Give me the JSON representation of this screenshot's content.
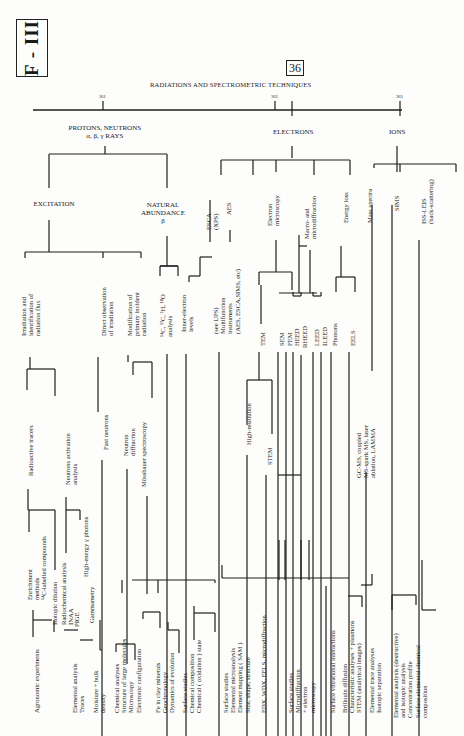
{
  "page": {
    "section_badge": "F - III",
    "chapter_number": "36",
    "title": "RADIATIONS AND SPECTROMETRIC TECHNIQUES",
    "tick_numbers": [
      {
        "label": "361",
        "x": 103,
        "y": 94
      },
      {
        "label": "362",
        "x": 275,
        "y": 94
      },
      {
        "label": "363",
        "x": 400,
        "y": 94
      }
    ]
  },
  "categories": [
    {
      "label": "PROTONS, NEUTRONS\nα, β, γ RAYS",
      "x": 105,
      "y": 124
    },
    {
      "label": "ELECTRONS",
      "x": 293,
      "y": 128
    },
    {
      "label": "IONS",
      "x": 397,
      "y": 128
    }
  ],
  "subcategories": [
    {
      "label": "EXCITATION",
      "x": 54,
      "y": 200
    },
    {
      "label": "NATURAL\nABUNDANCE\nβ",
      "x": 163,
      "y": 201
    }
  ],
  "vertical_labels": [
    {
      "id": "irradiation",
      "text": "Irradiation and\nidentification of\nradiation flux",
      "x": 20,
      "y": 336
    },
    {
      "id": "direct-observation",
      "text": "Direct observation\nof irradiation",
      "x": 100,
      "y": 336
    },
    {
      "id": "modification",
      "text": "Modification of\nprimary incident\nradiation",
      "x": 126,
      "y": 336
    },
    {
      "id": "isotope-analysis",
      "text": "¹⁴C, ¹³C, ²H, ¹⁸O\nanalysis",
      "x": 159,
      "y": 337
    },
    {
      "id": "inner-electron",
      "text": "Inner-electron\nlevels",
      "x": 180,
      "y": 332
    },
    {
      "id": "esca",
      "text": "ESCA\n(XPS)",
      "x": 205,
      "y": 230
    },
    {
      "id": "aes",
      "text": "AES",
      "x": 225,
      "y": 215
    },
    {
      "id": "see-ups",
      "text": "(see UPS)\nMultifunction\ninstruments\n(AES, ESCA,SIMS, etc)",
      "x": 212,
      "y": 334
    },
    {
      "id": "electron-microscopy",
      "text": "Electron\nmicroscopy",
      "x": 266,
      "y": 226
    },
    {
      "id": "macro-micro",
      "text": "Macro- and\nmicrodiffraction",
      "x": 303,
      "y": 239
    },
    {
      "id": "energy-loss",
      "text": "Energy loss",
      "x": 342,
      "y": 223
    },
    {
      "id": "mass-spectra",
      "text": "Mass spectra",
      "x": 366,
      "y": 223
    },
    {
      "id": "sims",
      "text": "SIMS",
      "x": 393,
      "y": 211
    },
    {
      "id": "iss-leis",
      "text": "ISS-LEIS\n(back-scattering)",
      "x": 420,
      "y": 224
    },
    {
      "id": "tem",
      "text": "TEM",
      "x": 259,
      "y": 346
    },
    {
      "id": "sem",
      "text": "SEM",
      "x": 278,
      "y": 346
    },
    {
      "id": "fem",
      "text": "FEM",
      "x": 286,
      "y": 346
    },
    {
      "id": "heed",
      "text": "HEED",
      "x": 293,
      "y": 346
    },
    {
      "id": "rheed",
      "text": "RHEED",
      "x": 301,
      "y": 348
    },
    {
      "id": "leed",
      "text": "LEED",
      "x": 313,
      "y": 346
    },
    {
      "id": "ileed",
      "text": "ILEED",
      "x": 321,
      "y": 346
    },
    {
      "id": "phonons",
      "text": "Phonons",
      "x": 331,
      "y": 346
    },
    {
      "id": "eels",
      "text": "EELS",
      "x": 349,
      "y": 346
    },
    {
      "id": "high-resolution",
      "text": "High-resolution",
      "x": 245,
      "y": 445
    },
    {
      "id": "stem",
      "text": "STEM",
      "x": 266,
      "y": 465
    },
    {
      "id": "gcms",
      "text": "GC-MS, coupled\nMS-spark MS, laser\nablation, LAMMA",
      "x": 355,
      "y": 478
    },
    {
      "id": "radioactive-tracers",
      "text": "Radioactive tracers",
      "x": 27,
      "y": 476
    },
    {
      "id": "neutrons-activation",
      "text": "Neutrons activation\nanalysis",
      "x": 64,
      "y": 485
    },
    {
      "id": "fast-neutrons",
      "text": "Fast neutrons",
      "x": 102,
      "y": 450
    },
    {
      "id": "neutron-diffraction",
      "text": "Neutron\ndiffraction",
      "x": 122,
      "y": 456
    },
    {
      "id": "mossbauer",
      "text": "Mössbauer spectroscopy",
      "x": 140,
      "y": 487
    },
    {
      "id": "enrichment",
      "text": "Enrichment\nmethods\n¹⁴C-labelled compounds",
      "x": 26,
      "y": 600
    },
    {
      "id": "isotopic-dilution",
      "text": "Isotopic dilution",
      "x": 51,
      "y": 625
    },
    {
      "id": "radiochemical",
      "text": "Radiochemical analysis\nINAA",
      "x": 60,
      "y": 625
    },
    {
      "id": "pige",
      "text": "PIGE",
      "x": 73,
      "y": 627
    },
    {
      "id": "high-energy-photons",
      "text": "High-energy γ photons",
      "x": 82,
      "y": 577
    },
    {
      "id": "gammametry",
      "text": "Gammametry",
      "x": 88,
      "y": 623
    },
    {
      "id": "agronomic",
      "text": "Agronomic experiments",
      "x": 33,
      "y": 713
    },
    {
      "id": "elemental-traces",
      "text": "Elemental analysis\nTraces",
      "x": 71,
      "y": 713
    },
    {
      "id": "moisture",
      "text": "Moisture + bulk\ndensity",
      "x": 92,
      "y": 713
    },
    {
      "id": "chemical-group",
      "text": "Chemical analyses\nStructure of large molecules\nMicroscopy\nElectronic configuration",
      "x": 113,
      "y": 713
    },
    {
      "id": "fe-group",
      "text": "Fe in clay minerals\nGeochronology\nDynamics of evolution",
      "x": 154,
      "y": 713
    },
    {
      "id": "surface-chemical",
      "text": "Surface studies\nChemical composition\nChemical ( oxidation ) state",
      "x": 181,
      "y": 713
    },
    {
      "id": "surface-micro",
      "text": "Surface studies\nElemental microanalysis\nElement mapping ( SAM )\nSize, shape, structure",
      "x": 222,
      "y": 713
    },
    {
      "id": "edx",
      "text": "EDX, WDX, EELS, microdiffraction",
      "x": 260,
      "y": 713
    },
    {
      "id": "surface-diffraction",
      "text": "Surface studies\nMicrodiffraction\n+ electron\nmicroscopy",
      "x": 287,
      "y": 713
    },
    {
      "id": "vibrational",
      "text": "Surface vibrational interactions",
      "x": 329,
      "y": 713
    },
    {
      "id": "brillouin",
      "text": "Brillouin diffusion\nCharacteristic analyses + plasmons\nSTEM (analytical images)",
      "x": 341,
      "y": 713
    },
    {
      "id": "trace-analyses",
      "text": "Elemental trace analyses\nIsotopic separation",
      "x": 368,
      "y": 713
    },
    {
      "id": "destructive",
      "text": "Elemental analysis (destructive)\nand isotopic analysis\nConcentration profile\nSurface elemental chemical\ncomposition",
      "x": 392,
      "y": 718
    }
  ],
  "lines": [
    [
      33,
      110,
      402,
      110
    ],
    [
      103,
      101,
      103,
      110
    ],
    [
      275,
      101,
      275,
      110
    ],
    [
      292,
      101,
      292,
      116
    ],
    [
      400,
      101,
      400,
      116
    ],
    [
      105,
      146,
      105,
      154
    ],
    [
      49,
      154,
      167,
      154
    ],
    [
      49,
      154,
      49,
      188
    ],
    [
      167,
      154,
      167,
      188
    ],
    [
      49,
      220,
      49,
      252
    ],
    [
      25,
      252,
      141,
      252
    ],
    [
      25,
      252,
      25,
      258
    ],
    [
      103,
      252,
      103,
      258
    ],
    [
      141,
      252,
      141,
      258
    ],
    [
      167,
      236,
      167,
      266
    ],
    [
      160,
      266,
      178,
      266
    ],
    [
      160,
      266,
      178,
      266
    ],
    [
      160,
      266,
      160,
      276
    ],
    [
      178,
      266,
      178,
      276
    ],
    [
      189,
      276,
      200,
      276
    ],
    [
      189,
      276,
      189,
      282
    ],
    [
      200,
      257,
      200,
      276
    ],
    [
      200,
      257,
      212,
      257
    ],
    [
      292,
      146,
      292,
      158
    ],
    [
      221,
      160,
      350,
      160
    ],
    [
      221,
      160,
      221,
      175
    ],
    [
      276,
      160,
      276,
      172
    ],
    [
      314,
      160,
      314,
      175
    ],
    [
      350,
      160,
      350,
      175
    ],
    [
      253,
      160,
      253,
      175
    ],
    [
      397,
      146,
      397,
      172
    ],
    [
      374,
      164,
      456,
      164
    ],
    [
      374,
      164,
      374,
      168
    ],
    [
      456,
      164,
      456,
      172
    ],
    [
      400,
      164,
      400,
      172
    ],
    [
      210,
      200,
      210,
      242
    ],
    [
      230,
      230,
      230,
      242
    ],
    [
      299,
      235,
      299,
      293
    ],
    [
      279,
      293,
      317,
      293
    ],
    [
      299,
      246,
      307,
      246
    ],
    [
      310,
      250,
      310,
      293
    ],
    [
      261,
      285,
      261,
      324
    ],
    [
      341,
      246,
      341,
      277
    ],
    [
      336,
      277,
      355,
      277
    ],
    [
      336,
      277,
      336,
      292
    ],
    [
      355,
      277,
      355,
      292
    ],
    [
      276,
      240,
      276,
      272
    ],
    [
      259,
      272,
      292,
      272
    ],
    [
      259,
      272,
      259,
      285
    ],
    [
      292,
      272,
      292,
      290
    ],
    [
      293,
      292,
      293,
      296
    ],
    [
      301,
      292,
      301,
      296
    ],
    [
      293,
      296,
      301,
      296
    ],
    [
      313,
      292,
      313,
      296
    ],
    [
      321,
      292,
      321,
      296
    ],
    [
      313,
      296,
      321,
      296
    ],
    [
      30,
      357,
      30,
      369
    ],
    [
      27,
      369,
      55,
      369
    ],
    [
      27,
      369,
      27,
      390
    ],
    [
      55,
      369,
      55,
      396
    ],
    [
      98,
      357,
      98,
      412
    ],
    [
      128,
      355,
      128,
      362
    ],
    [
      133,
      362,
      152,
      362
    ],
    [
      133,
      362,
      133,
      375
    ],
    [
      152,
      362,
      152,
      398
    ],
    [
      167,
      354,
      167,
      736
    ],
    [
      186,
      354,
      186,
      736
    ],
    [
      219,
      352,
      219,
      736
    ],
    [
      259,
      352,
      259,
      380
    ],
    [
      247,
      380,
      272,
      380
    ],
    [
      247,
      380,
      247,
      425
    ],
    [
      272,
      380,
      272,
      434
    ],
    [
      278,
      352,
      278,
      736
    ],
    [
      286,
      352,
      286,
      736
    ],
    [
      293,
      352,
      293,
      736
    ],
    [
      301,
      355,
      301,
      736
    ],
    [
      313,
      352,
      313,
      736
    ],
    [
      321,
      352,
      321,
      736
    ],
    [
      331,
      352,
      331,
      736
    ],
    [
      349,
      352,
      349,
      736
    ],
    [
      392,
      205,
      392,
      736
    ],
    [
      372,
      205,
      372,
      371
    ],
    [
      419,
      240,
      419,
      736
    ],
    [
      366,
      472,
      366,
      736
    ],
    [
      28,
      489,
      28,
      510
    ],
    [
      28,
      510,
      55,
      510
    ],
    [
      55,
      510,
      55,
      570
    ],
    [
      29,
      510,
      29,
      532
    ],
    [
      66,
      497,
      66,
      510
    ],
    [
      66,
      510,
      80,
      510
    ],
    [
      66,
      510,
      66,
      553
    ],
    [
      80,
      510,
      80,
      520
    ],
    [
      102,
      460,
      102,
      736
    ],
    [
      127,
      469,
      127,
      664
    ],
    [
      147,
      496,
      147,
      594
    ],
    [
      247,
      455,
      247,
      736
    ],
    [
      266,
      475,
      266,
      736
    ],
    [
      278,
      475,
      301,
      475
    ],
    [
      215,
      580,
      215,
      583
    ],
    [
      132,
      580,
      215,
      580
    ],
    [
      122,
      580,
      122,
      593
    ],
    [
      158,
      580,
      158,
      593
    ],
    [
      33,
      610,
      33,
      637
    ],
    [
      33,
      620,
      52,
      620
    ],
    [
      54,
      620,
      54,
      632
    ],
    [
      64,
      630,
      78,
      630
    ],
    [
      80,
      640,
      93,
      640
    ],
    [
      100,
      620,
      100,
      650
    ],
    [
      102,
      650,
      100,
      650
    ],
    [
      116,
      644,
      116,
      652
    ],
    [
      116,
      644,
      135,
      644
    ],
    [
      135,
      644,
      135,
      660
    ],
    [
      143,
      612,
      143,
      619
    ],
    [
      143,
      612,
      160,
      612
    ],
    [
      160,
      612,
      160,
      628
    ],
    [
      168,
      622,
      168,
      630
    ],
    [
      168,
      630,
      179,
      630
    ],
    [
      179,
      630,
      179,
      653
    ],
    [
      194,
      606,
      194,
      640
    ],
    [
      194,
      613,
      215,
      613
    ],
    [
      215,
      613,
      215,
      632
    ],
    [
      222,
      565,
      222,
      578
    ],
    [
      222,
      578,
      349,
      578
    ],
    [
      279,
      540,
      279,
      580
    ],
    [
      285,
      540,
      285,
      580
    ],
    [
      301,
      540,
      301,
      580
    ],
    [
      309,
      540,
      309,
      580
    ],
    [
      372,
      574,
      372,
      585
    ],
    [
      372,
      585,
      361,
      585
    ],
    [
      348,
      596,
      362,
      596
    ],
    [
      362,
      596,
      362,
      607
    ],
    [
      326,
      586,
      326,
      740
    ],
    [
      392,
      595,
      392,
      610
    ],
    [
      392,
      595,
      416,
      595
    ],
    [
      416,
      595,
      416,
      605
    ],
    [
      422,
      610,
      436,
      610
    ],
    [
      422,
      560,
      422,
      610
    ]
  ]
}
